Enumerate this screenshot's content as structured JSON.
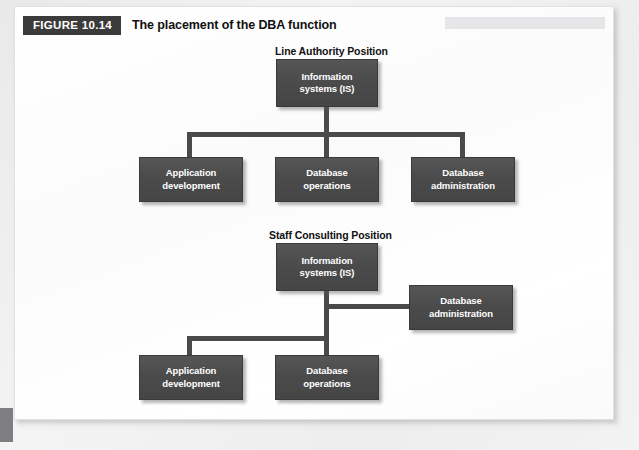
{
  "figure": {
    "badge_label": "FIGURE 10.14",
    "caption": "The placement of the DBA function"
  },
  "diagrams": [
    {
      "id": "line-authority",
      "title": "Line Authority Position",
      "root": {
        "line1": "Information",
        "line2": "systems (IS)"
      },
      "children": [
        {
          "line1": "Application",
          "line2": "development"
        },
        {
          "line1": "Database",
          "line2": "operations"
        },
        {
          "line1": "Database",
          "line2": "administration"
        }
      ]
    },
    {
      "id": "staff-consulting",
      "title": "Staff Consulting Position",
      "root": {
        "line1": "Information",
        "line2": "systems (IS)"
      },
      "staff": {
        "line1": "Database",
        "line2": "administration"
      },
      "children": [
        {
          "line1": "Application",
          "line2": "development"
        },
        {
          "line1": "Database",
          "line2": "operations"
        }
      ]
    }
  ],
  "colors": {
    "badge_background": "#3b3b3b",
    "node_fill": "#4b4b4b",
    "node_text": "#ffffff",
    "connector": "#4a4a4a",
    "panel_background": "#ffffff",
    "page_background": "#f2f2f3"
  }
}
